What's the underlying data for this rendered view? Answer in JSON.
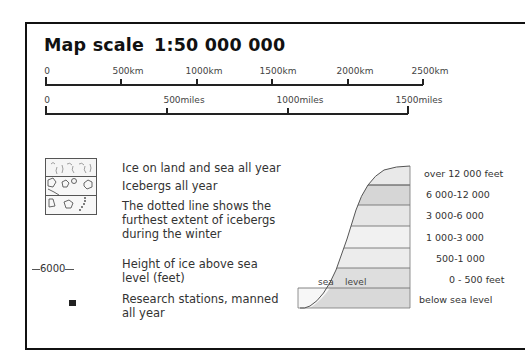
{
  "title": {
    "label": "Map scale",
    "scale": "1:50 000 000"
  },
  "km_scale": {
    "ticks": [
      "0",
      "500km",
      "1000km",
      "1500km",
      "2000km",
      "2500km"
    ]
  },
  "miles_scale": {
    "ticks": [
      "0",
      "500miles",
      "1000miles",
      "1500miles"
    ]
  },
  "legend": {
    "items": [
      {
        "icon": "ice-hatch-icon",
        "label": "Ice on land and sea all year"
      },
      {
        "icon": "iceberg-icon",
        "label": "Icebergs all year"
      },
      {
        "icon": "dotted-line-icon",
        "label": "The dotted line shows the furthest extent of icebergs during the winter"
      },
      {
        "icon": "contour-line-icon",
        "sample": "6000",
        "label": "Height of ice above sea level (feet)"
      },
      {
        "icon": "research-station-icon",
        "label": "Research stations, manned all year"
      }
    ]
  },
  "elevation_key": {
    "sea_label": "sea",
    "level_label": "level",
    "bands": [
      {
        "label": "over 12 000 feet",
        "color": "#e9e9e9"
      },
      {
        "label": "6 000-12 000",
        "color": "#d6d6d6"
      },
      {
        "label": "3 000-6 000",
        "color": "#e6e6e6"
      },
      {
        "label": "1 000-3 000",
        "color": "#f1f1f1"
      },
      {
        "label": "500-1 000",
        "color": "#ececec"
      },
      {
        "label": "0 - 500 feet",
        "color": "#dedede"
      },
      {
        "label": "below sea level",
        "color": "#d9d9d9"
      }
    ]
  }
}
